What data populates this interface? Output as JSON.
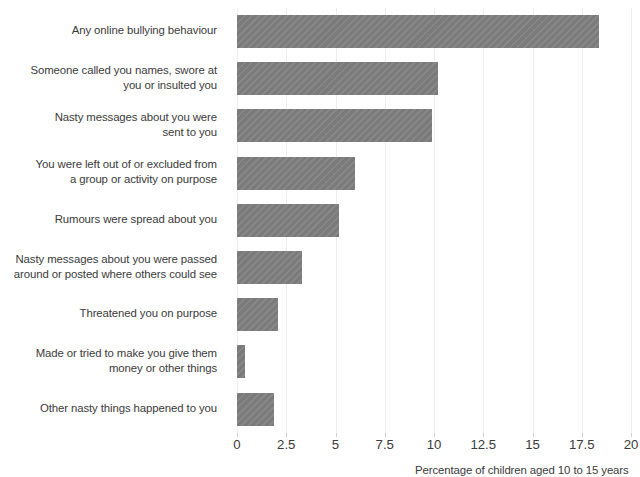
{
  "chart_data": {
    "type": "bar",
    "orientation": "horizontal",
    "title": "",
    "xlabel": "Percentage of children aged 10 to 15 years",
    "ylabel": "",
    "xlim": [
      0,
      20
    ],
    "xticks": [
      "0",
      "2.5",
      "5",
      "7.5",
      "10",
      "12.5",
      "15",
      "17.5",
      "20"
    ],
    "xtick_values": [
      0,
      2.5,
      5,
      7.5,
      10,
      12.5,
      15,
      17.5,
      20
    ],
    "grid": true,
    "grid_axis": "x",
    "legend": "none",
    "bar_color": "#808080",
    "categories": [
      "Any online bullying behaviour",
      "Someone called you names, swore at you or insulted you",
      "Nasty messages about you were sent to you",
      "You were left out of or excluded from a group or activity on purpose",
      "Rumours were spread about you",
      "Nasty messages about you were passed around or posted where others could see",
      "Threatened you on purpose",
      "Made or tried to make you give them money or other things",
      "Other nasty things happened to you"
    ],
    "values": [
      18.4,
      10.2,
      9.9,
      6.0,
      5.2,
      3.3,
      2.1,
      0.4,
      1.9
    ]
  },
  "labels": {
    "lines": [
      [
        "Any online bullying behaviour"
      ],
      [
        "Someone called you names, swore at",
        "you or insulted you"
      ],
      [
        "Nasty messages about you were",
        "sent to you"
      ],
      [
        "You were left out of or excluded from",
        "a group or activity on purpose"
      ],
      [
        "Rumours were spread about you"
      ],
      [
        "Nasty messages about you were passed",
        "around or posted where others could see"
      ],
      [
        "Threatened you on purpose"
      ],
      [
        "Made or tried to make you give them",
        "money or other things"
      ],
      [
        "Other nasty things happened to you"
      ]
    ]
  }
}
